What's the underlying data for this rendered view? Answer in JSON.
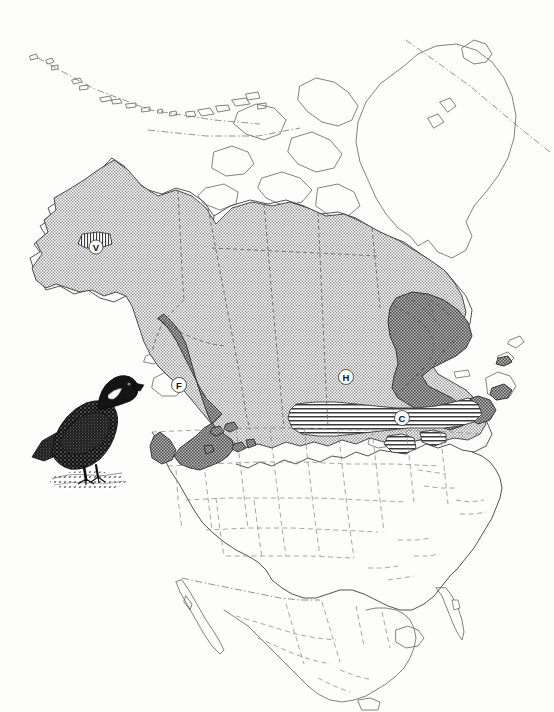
{
  "figure": {
    "title": "Spruce Grouse range map of North America",
    "caption": "",
    "background_color": "#fdfdfc",
    "width": 554,
    "height": 712
  },
  "map": {
    "name": "north-america-range-map",
    "projection_note": "North America including Alaska, Canada, Greenland, conterminous United States and northern Mexico",
    "outline_color": "#6b6b6b",
    "internal_border_color": "#8a8a8a",
    "land_fill": "#ffffff"
  },
  "legend_labels": [
    {
      "id": "V",
      "letter": "V",
      "region": "Alaska interior",
      "pattern": "vertical-hatch",
      "x": 96,
      "y": 247
    },
    {
      "id": "F",
      "letter": "F",
      "region": "Pacific Northwest / British Columbia interior",
      "pattern": "dark-stipple",
      "x": 179,
      "y": 385
    },
    {
      "id": "H",
      "letter": "H",
      "region": "central Canada boreal forest",
      "pattern": "stipple",
      "x": 346,
      "y": 377
    },
    {
      "id": "C",
      "letter": "C",
      "region": "southern boreal edge / Great Lakes",
      "pattern": "horizontal-hatch",
      "x": 402,
      "y": 418
    }
  ],
  "patterns": {
    "stipple": {
      "label": "light stipple",
      "color": "#8e8e8e"
    },
    "dark_stipple": {
      "label": "dark stipple",
      "color": "#585858"
    },
    "horizontal_hatch": {
      "label": "horizontal hatch band",
      "color": "#3a3a3a"
    },
    "vertical_hatch": {
      "label": "vertical hatch",
      "color": "#3a3a3a"
    }
  },
  "illustration": {
    "name": "grouse-illustration",
    "subject": "grouse",
    "style": "stippled engraving",
    "color": "#1a1a1a",
    "position": {
      "x": 28,
      "y": 355,
      "width": 120,
      "height": 145
    }
  }
}
